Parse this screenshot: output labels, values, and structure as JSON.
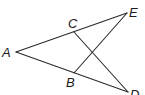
{
  "diagram": {
    "type": "geometry-figure",
    "points": {
      "A": {
        "label": "A",
        "x": 16,
        "y": 52
      },
      "B": {
        "label": "B",
        "x": 74,
        "y": 73
      },
      "C": {
        "label": "C",
        "x": 74,
        "y": 32
      },
      "D": {
        "label": "D",
        "x": 128,
        "y": 92
      },
      "E": {
        "label": "E",
        "x": 127,
        "y": 13
      }
    },
    "segments": [
      {
        "name": "AE",
        "from": "A",
        "to": "E"
      },
      {
        "name": "AD",
        "from": "A",
        "to": "D"
      },
      {
        "name": "CD",
        "from": "C",
        "to": "D"
      },
      {
        "name": "BE",
        "from": "B",
        "to": "E"
      }
    ],
    "stroke_color": "#2a2a2a"
  }
}
